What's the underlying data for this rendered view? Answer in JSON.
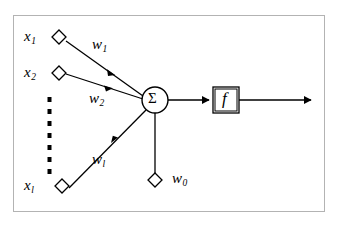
{
  "figure": {
    "frame": {
      "stroke": "#b3b3b3",
      "fill": "#ffffff"
    },
    "ink": "#000000"
  },
  "diagram_data": {
    "type": "node-link-diagram",
    "nodes": [
      {
        "id": "x1",
        "shape": "diamond",
        "label": "x",
        "subscript": "1",
        "x": 59,
        "y": 37
      },
      {
        "id": "x2",
        "shape": "diamond",
        "label": "x",
        "subscript": "2",
        "x": 59,
        "y": 73
      },
      {
        "id": "xl",
        "shape": "diamond",
        "label": "x",
        "subscript": "l",
        "x": 62,
        "y": 186
      },
      {
        "id": "w0",
        "shape": "diamond",
        "label": "w",
        "subscript": "0",
        "x": 155,
        "y": 180
      },
      {
        "id": "sum",
        "shape": "circle",
        "label": "Σ",
        "x": 155,
        "y": 100,
        "r": 13
      },
      {
        "id": "act",
        "shape": "box",
        "label": "f",
        "x": 226,
        "y": 100,
        "w": 26,
        "h": 26
      }
    ],
    "edges": [
      {
        "from": "x1",
        "to": "sum",
        "weight_label": "w",
        "weight_subscript": "1",
        "arrow": "mid"
      },
      {
        "from": "x2",
        "to": "sum",
        "weight_label": "w",
        "weight_subscript": "2",
        "arrow": "mid"
      },
      {
        "from": "xl",
        "to": "sum",
        "weight_label": "w",
        "weight_subscript": "l",
        "arrow": "mid"
      },
      {
        "from": "w0",
        "to": "sum",
        "weight_label": "",
        "weight_subscript": "",
        "arrow": "none"
      },
      {
        "from": "sum",
        "to": "act",
        "weight_label": "",
        "weight_subscript": "",
        "arrow": "end"
      },
      {
        "from": "act",
        "to": "output",
        "weight_label": "",
        "weight_subscript": "",
        "arrow": "end"
      }
    ],
    "ellipsis": {
      "orientation": "vertical",
      "dots": 7,
      "x": 50,
      "y_start": 99,
      "y_end": 169
    }
  },
  "labels": {
    "x1": "x",
    "x1_sub": "1",
    "x2": "x",
    "x2_sub": "2",
    "xl": "x",
    "xl_sub": "l",
    "w1": "w",
    "w1_sub": "1",
    "w2": "w",
    "w2_sub": "2",
    "wl": "w",
    "wl_sub": "l",
    "w0": "w",
    "w0_sub": "0",
    "sigma": "Σ",
    "activation": "f"
  }
}
